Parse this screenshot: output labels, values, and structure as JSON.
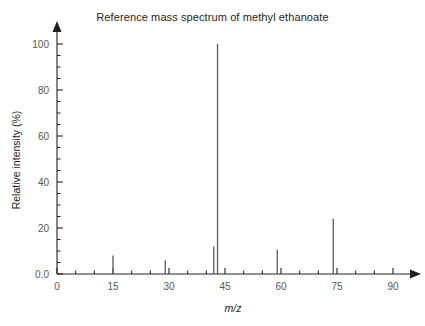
{
  "chart_data": {
    "type": "bar",
    "title": "Reference mass spectrum of methyl ethanoate",
    "xlabel": "m/z",
    "ylabel": "Relative intensity (%)",
    "xlim": [
      0,
      90
    ],
    "ylim": [
      0,
      100
    ],
    "grid": false,
    "legend": "none",
    "x_major_ticks": [
      "0",
      "15",
      "30",
      "45",
      "60",
      "75",
      "90"
    ],
    "x_major_values": [
      0,
      15,
      30,
      45,
      60,
      75,
      90
    ],
    "x_minor_step": 5,
    "y_ticks": [
      "0.0",
      "20",
      "40",
      "60",
      "80",
      "100"
    ],
    "y_values": [
      0,
      20,
      40,
      60,
      80,
      100
    ],
    "y_minor_step": 5,
    "categories": [
      15,
      29,
      42,
      43,
      59,
      74
    ],
    "values": [
      8,
      6,
      12,
      100,
      10.5,
      24
    ],
    "peaks": [
      {
        "mz": 15,
        "intensity": 8
      },
      {
        "mz": 29,
        "intensity": 6
      },
      {
        "mz": 42,
        "intensity": 12
      },
      {
        "mz": 43,
        "intensity": 100
      },
      {
        "mz": 59,
        "intensity": 10.5
      },
      {
        "mz": 74,
        "intensity": 24
      }
    ],
    "series_color": "#58595b",
    "axis_color": "#231f20"
  },
  "figure": {
    "title": "Reference mass spectrum of methyl ethanoate",
    "y_axis_label": "Relative intensity (%)",
    "x_axis_label": "m/z",
    "background": "#ffffff"
  }
}
